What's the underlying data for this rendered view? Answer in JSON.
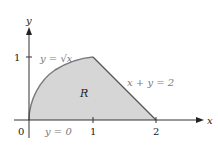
{
  "diagram": {
    "axes": {
      "x_label": "x",
      "y_label": "y"
    },
    "ticks": {
      "x": [
        "1",
        "2"
      ],
      "y": [
        "1"
      ],
      "origin": "0"
    },
    "curves": {
      "sqrt": "y = √x",
      "line": "x + y = 2",
      "base": "y = 0"
    },
    "region_label": "R",
    "colors": {
      "fill": "#d6d6d6",
      "curve": "#7a7a7a",
      "axis": "#333333"
    }
  }
}
